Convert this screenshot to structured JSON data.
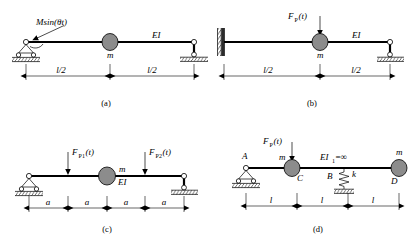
{
  "figure": {
    "background_color": "#ffffff",
    "line_color": "#000000",
    "mass_fill_color": "#8c8c8c"
  },
  "panels": [
    {
      "id": "a",
      "caption": "(a)",
      "description": "Simply supported beam with central mass and harmonic moment at left support",
      "load_label": "Msin(θt)",
      "load_type": "moment",
      "mass_label": "m",
      "stiffness_label": "EI",
      "left_support": "pinned-roller",
      "right_support": "vertical-link",
      "dimensions": [
        "l/2",
        "l/2"
      ],
      "segment_count": 2
    },
    {
      "id": "b",
      "caption": "(b)",
      "description": "Fixed-end beam with central mass and vertical dynamic force",
      "load_label": "F",
      "load_subscript": "P",
      "load_suffix": "(t)",
      "load_label_full": "FP(t)",
      "load_type": "point-force",
      "mass_label": "m",
      "stiffness_label": "EI",
      "left_support": "fixed-wall",
      "right_support": "vertical-link",
      "dimensions": [
        "l/2",
        "l/2"
      ],
      "segment_count": 2
    },
    {
      "id": "c",
      "caption": "(c)",
      "description": "Simply supported beam, four equal segments, two dynamic point forces and a central mass",
      "load_labels": [
        {
          "base": "F",
          "sub": "P1",
          "suffix": "(t)",
          "full": "FP1(t)"
        },
        {
          "base": "F",
          "sub": "P2",
          "suffix": "(t)",
          "full": "FP2(t)"
        }
      ],
      "load_type": "point-force",
      "mass_label": "m",
      "stiffness_label": "EI",
      "left_support": "pinned-roller",
      "right_support": "roller",
      "dimensions": [
        "a",
        "a",
        "a",
        "a"
      ],
      "segment_count": 4
    },
    {
      "id": "d",
      "caption": "(d)",
      "description": "Rigid beam on pin and spring support carrying two masses with dynamic force",
      "load_label_full": "FP(t)",
      "load_base": "F",
      "load_sub": "P",
      "load_suffix": "(t)",
      "load_type": "point-force",
      "node_labels": [
        "A",
        "C",
        "B",
        "D"
      ],
      "mass_labels": [
        "m",
        "m"
      ],
      "stiffness_label": "EI1=∞",
      "stiffness_base": "EI",
      "stiffness_sub": "1",
      "stiffness_value": "=∞",
      "spring_label": "k",
      "left_support": "pinned-roller",
      "mid_support": "spring",
      "right_end": "free",
      "dimensions": [
        "l",
        "l",
        "l"
      ],
      "segment_count": 3
    }
  ]
}
